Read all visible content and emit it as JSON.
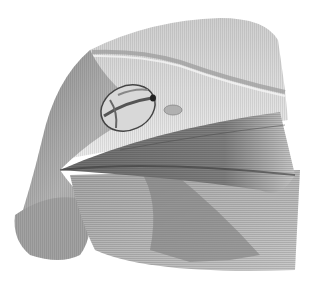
{
  "image": {
    "subject": "anatomical illustration of shoulder and pectoral region",
    "style": "grayscale pencil/hatched drawing",
    "colors": {
      "background": "#ffffff",
      "skin_light": "#e4e4e4",
      "skin_mid": "#b8b8b8",
      "muscle_dark": "#6a6a6a",
      "muscle_darkest": "#3a3a3a"
    }
  }
}
